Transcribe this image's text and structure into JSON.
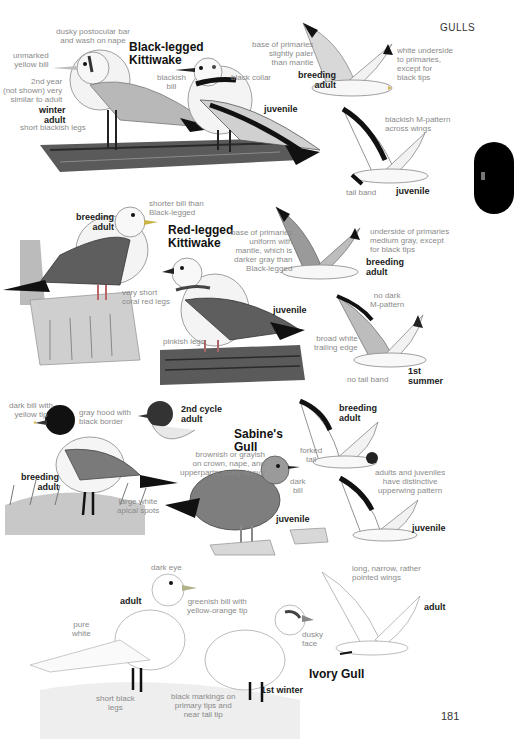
{
  "header": {
    "section": "GULLS",
    "page_number": "181"
  },
  "thumb_tab": {
    "color": "#000000"
  },
  "species": [
    {
      "name": "Black-legged\nKittiwake",
      "plates": [
        {
          "age": "winter\nadult"
        },
        {
          "age": "juvenile"
        },
        {
          "age": "breeding\nadult"
        },
        {
          "age": "juvenile"
        }
      ],
      "labels": {
        "postocular": "dusky postocular bar\nand wash on nape",
        "bill": "unmarked\nyellow bill",
        "second_year": "2nd year\n(not shown) very\nsimilar to adult",
        "legs": "short blackish legs",
        "juv_bill": "blackish\nbill",
        "collar": "black collar",
        "primaries_base": "base of primaries\nslightly paler\nthan mantle",
        "underside": "white underside\nto primaries,\nexcept for\nblack tips",
        "m_pattern": "blackish M-pattern\nacross wings",
        "tail_band": "tail band"
      }
    },
    {
      "name": "Red-legged\nKittiwake",
      "plates": [
        {
          "age": "breeding\nadult"
        },
        {
          "age": "juvenile"
        },
        {
          "age": "breeding\nadult"
        },
        {
          "age": "1st\nsummer"
        }
      ],
      "labels": {
        "shorter_bill": "shorter bill than\nBlack-legged",
        "legs": "very short\ncoral red legs",
        "pinkish_legs": "pinkish legs",
        "primaries_base": "base of primaries\nuniform with\nmantle, which is\ndarker gray than\nBlack-legged",
        "underside": "underside of primaries\nmedium gray, except\nfor black tips",
        "no_m": "no dark\nM-pattern",
        "trailing": "broad white\ntrailing edge",
        "no_tail_band": "no tail band"
      }
    },
    {
      "name": "Sabine's\nGull",
      "plates": [
        {
          "age": "breeding\nadult"
        },
        {
          "age": "2nd cycle\nadult"
        },
        {
          "age": "juvenile"
        },
        {
          "age": "breeding\nadult"
        },
        {
          "age": "juvenile"
        }
      ],
      "labels": {
        "bill": "dark bill with\nyellow tip",
        "hood": "gray hood with\nblack border",
        "apical": "large white\napical spots",
        "brownish": "brownish or grayish\non crown, nape, and\nupperparts; scaly above",
        "dark_bill": "dark\nbill",
        "forked": "forked\ntail",
        "upperwing": "adults and juveniles\nhave distinctive\nupperwing pattern"
      }
    },
    {
      "name": "Ivory Gull",
      "plates": [
        {
          "age": "adult"
        },
        {
          "age": "1st winter"
        },
        {
          "age": "adult"
        }
      ],
      "labels": {
        "dark_eye": "dark eye",
        "bill": "greenish bill with\nyellow-orange tip",
        "pure_white": "pure\nwhite",
        "legs": "short black\nlegs",
        "markings": "black markings on\nprimary tips and\nnear tail tip",
        "dusky_face": "dusky\nface",
        "wings": "long, narrow, rather\npointed wings"
      }
    }
  ]
}
